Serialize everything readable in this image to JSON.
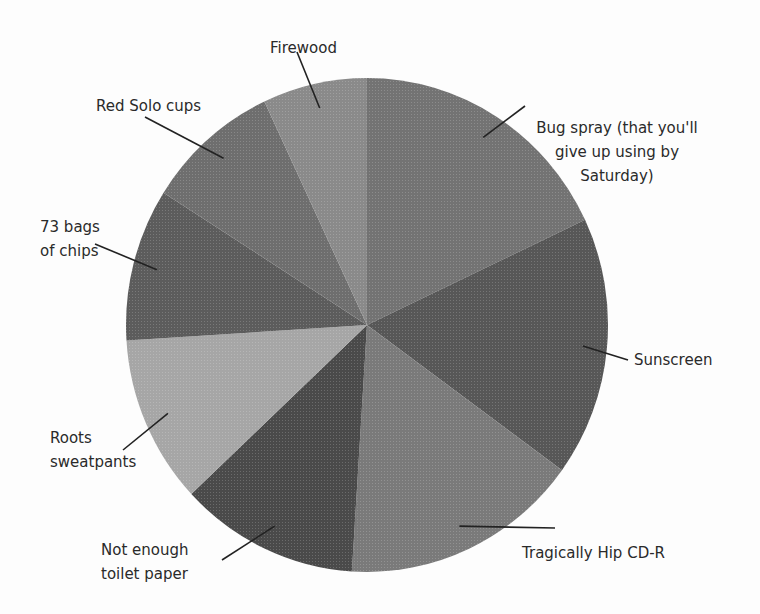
{
  "chart_data": {
    "type": "pie",
    "title": "",
    "start_angle_deg": 0,
    "direction": "clockwise",
    "categories": [
      "Bug spray (that you'll give up using by Saturday)",
      "Sunscreen",
      "Tragically Hip CD-R",
      "Not enough toilet paper",
      "Roots sweatpants",
      "73 bags of chips",
      "Red Solo cups",
      "Firewood"
    ],
    "values": [
      18,
      17,
      16,
      12,
      11,
      10,
      9,
      7
    ],
    "colors": [
      "#737373",
      "#575757",
      "#7a7a7a",
      "#4a4a4a",
      "#a6a6a6",
      "#5c5c5c",
      "#6e6e6e",
      "#8a8a8a"
    ],
    "legend": "none (callout labels)"
  },
  "labels": [
    {
      "text": "Bug spray (that you'll\ngive up using by\nSaturday)"
    },
    {
      "text": "Sunscreen"
    },
    {
      "text": "Tragically Hip CD-R"
    },
    {
      "text": "Not enough\ntoilet paper"
    },
    {
      "text": "Roots\nsweatpants"
    },
    {
      "text": "73 bags\nof chips"
    },
    {
      "text": "Red Solo cups"
    },
    {
      "text": "Firewood"
    }
  ]
}
